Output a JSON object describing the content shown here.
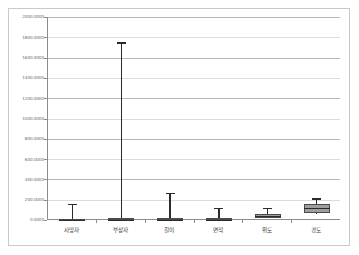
{
  "chart_data": {
    "type": "box",
    "title": "",
    "subtitle": "",
    "xlabel": "",
    "ylabel": "",
    "ylim": [
      0,
      2000
    ],
    "ytick_step": 200,
    "grid": true,
    "legend": null,
    "legend_position": "none",
    "categories": [
      "사망자",
      "부상자",
      "길이",
      "면적",
      "위도",
      "경도"
    ],
    "ytick_labels": [
      "2000.0000",
      "1800.0000",
      "1600.0000",
      "1400.0000",
      "1200.0000",
      "1000.0000",
      "800.0000",
      "600.0000",
      "400.0000",
      "200.0000",
      "0.0000"
    ],
    "ytick_values": [
      2000,
      1800,
      1600,
      1400,
      1200,
      1000,
      800,
      600,
      400,
      200,
      0
    ],
    "boxes": [
      {
        "category": "사망자",
        "whisker_low": 0,
        "q1": 0,
        "median": 0,
        "q3": 14,
        "whisker_high": 160
      },
      {
        "category": "부상자",
        "whisker_low": 0,
        "q1": 0,
        "median": 0,
        "q3": 18,
        "whisker_high": 1750
      },
      {
        "category": "길이",
        "whisker_low": 0,
        "q1": 0,
        "median": 0,
        "q3": 22,
        "whisker_high": 270
      },
      {
        "category": "면적",
        "whisker_low": 0,
        "q1": 0,
        "median": 0,
        "q3": 16,
        "whisker_high": 120
      },
      {
        "category": "위도",
        "whisker_low": 18,
        "q1": 22,
        "median": 36,
        "q3": 56,
        "whisker_high": 120
      },
      {
        "category": "경도",
        "whisker_low": 62,
        "q1": 72,
        "median": 118,
        "q3": 160,
        "whisker_high": 215
      }
    ],
    "colors": {
      "box_fill": "#9e9e9e",
      "box_edge": "#4a4a4a",
      "whisker": "#2b2b2b",
      "gridline": "#b5b5b5",
      "axis": "#8c8c8c",
      "plot_background": "#ffffff",
      "figure_background": "#ffffff",
      "tick_label": "#6b6b6b",
      "category_label": "#3a3a3a"
    }
  }
}
